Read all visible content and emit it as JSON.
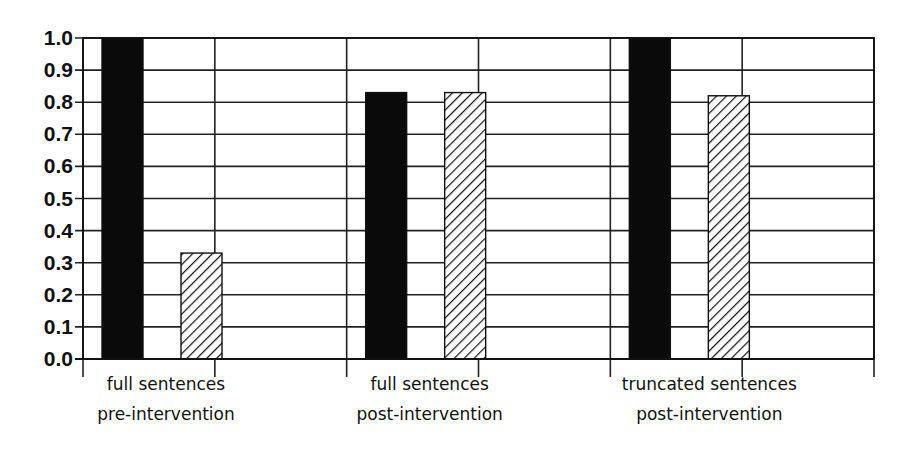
{
  "chart_data": {
    "type": "bar",
    "title": "",
    "xlabel": "",
    "ylabel": "",
    "ylim": [
      0.0,
      1.0
    ],
    "yticks": [
      "0.0",
      "0.1",
      "0.2",
      "0.3",
      "0.4",
      "0.5",
      "0.6",
      "0.7",
      "0.8",
      "0.9",
      "1.0"
    ],
    "grid": true,
    "legend": null,
    "categories": [
      [
        "full sentences",
        "pre-intervention"
      ],
      [
        "full sentences",
        "post-intervention"
      ],
      [
        "truncated sentences",
        "post-intervention"
      ]
    ],
    "series": [
      {
        "name": "series 1 (solid black)",
        "style": "solid",
        "color": "#000000",
        "values": [
          1.0,
          0.83,
          1.0
        ]
      },
      {
        "name": "series 2 (hatched)",
        "style": "hatched",
        "color": "#ffffff",
        "values": [
          0.33,
          0.83,
          0.82
        ]
      }
    ]
  }
}
